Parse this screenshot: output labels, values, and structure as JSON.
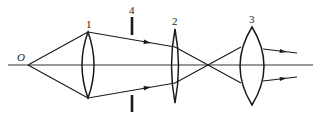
{
  "diagram": {
    "colors": {
      "stroke": "#1a1a1a",
      "background": "#ffffff"
    },
    "object_point": {
      "label": "O",
      "x": 28,
      "y": 65
    },
    "optical_axis": {
      "x1": 8,
      "x2": 313,
      "y": 65
    },
    "lenses": [
      {
        "id": "1",
        "label": "1",
        "x": 88,
        "top": 32,
        "bottom": 98,
        "half_width": 6,
        "type": "converging"
      },
      {
        "id": "2",
        "label": "2",
        "x": 175,
        "top": 29,
        "bottom": 103,
        "half_width": 3.5,
        "type": "converging"
      },
      {
        "id": "3",
        "label": "3",
        "x": 252,
        "top": 27,
        "bottom": 105,
        "half_width": 12,
        "type": "converging"
      }
    ],
    "aperture_stop": {
      "id": "4",
      "label": "4",
      "x": 132,
      "upper": [
        17,
        35
      ],
      "lower": [
        95,
        112
      ]
    },
    "crossover_point": {
      "x": 211,
      "y": 65
    },
    "elements": [
      {
        "name": "object-point",
        "label": "O"
      },
      {
        "name": "lens-1",
        "label": "1"
      },
      {
        "name": "aperture-stop-4",
        "label": "4"
      },
      {
        "name": "lens-2",
        "label": "2"
      },
      {
        "name": "lens-3",
        "label": "3"
      }
    ]
  }
}
